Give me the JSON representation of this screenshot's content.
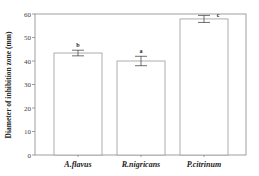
{
  "chart_data": {
    "type": "bar",
    "title": "",
    "xlabel": "",
    "ylabel": "Diameter of inhibition zone (mm)",
    "categories": [
      "A.flavus",
      "R.nigricans",
      "P.citrinum"
    ],
    "values": [
      43.4,
      40.0,
      57.9
    ],
    "errors": [
      1.2,
      2.0,
      1.5
    ],
    "significance_letters": [
      "b",
      "a",
      "c"
    ],
    "ylim": [
      0,
      60
    ],
    "yticks": [
      0,
      10,
      20,
      30,
      40,
      50,
      60
    ],
    "grid": false,
    "legend": "none",
    "colors": {
      "bar_fill": "#ffffff",
      "bar_stroke": "#999999",
      "axis": "#888888"
    }
  }
}
